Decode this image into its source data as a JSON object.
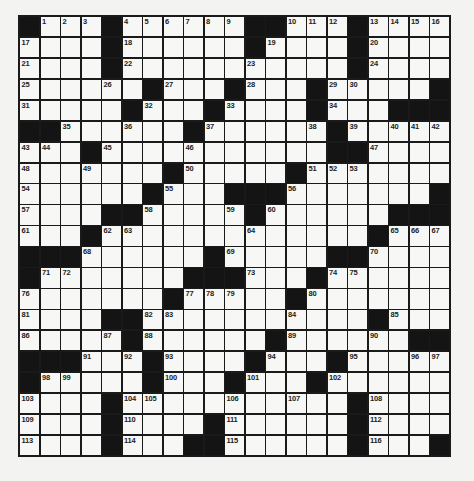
{
  "puzzle": {
    "rows": 21,
    "cols": 21,
    "colors": {
      "black_cell": "#141414",
      "white_cell": "#f7f7f5",
      "grid_line": "#1a1a1a",
      "background": "#f3f3f1"
    },
    "grid": [
      "#...#......##...#....",
      "....#......#....#....",
      "....#...........#....",
      "......#...#...#.....#",
      ".....#...#....#...###",
      "##......#......#.....",
      "...#...........##....",
      ".......#.....#.......",
      "......#...###.......#",
      "....##.....#......###",
      "...#.............#...",
      "###......#.....##....",
      "#.......###...#......",
      ".......#.....#.......",
      "....##...........#...",
      ".....#......#......##",
      "###...#....#...#.....",
      "#.....#...#...#......",
      "....#...........#....",
      "....#....#......#....",
      "....#...##......#...#"
    ],
    "numbers": [
      [
        0,
        1,
        1
      ],
      [
        0,
        2,
        2
      ],
      [
        0,
        3,
        3
      ],
      [
        0,
        5,
        4
      ],
      [
        0,
        6,
        5
      ],
      [
        0,
        7,
        6
      ],
      [
        0,
        8,
        7
      ],
      [
        0,
        9,
        8
      ],
      [
        0,
        10,
        9
      ],
      [
        0,
        13,
        10
      ],
      [
        0,
        14,
        11
      ],
      [
        0,
        15,
        12
      ],
      [
        0,
        17,
        13
      ],
      [
        0,
        18,
        14
      ],
      [
        0,
        19,
        15
      ],
      [
        0,
        20,
        16
      ],
      [
        1,
        0,
        17
      ],
      [
        1,
        5,
        18
      ],
      [
        1,
        12,
        19
      ],
      [
        1,
        17,
        20
      ],
      [
        2,
        0,
        21
      ],
      [
        2,
        5,
        22
      ],
      [
        2,
        11,
        23
      ],
      [
        2,
        17,
        24
      ],
      [
        3,
        0,
        25
      ],
      [
        3,
        4,
        26
      ],
      [
        3,
        7,
        27
      ],
      [
        3,
        11,
        28
      ],
      [
        3,
        15,
        29
      ],
      [
        3,
        16,
        30
      ],
      [
        4,
        0,
        31
      ],
      [
        4,
        6,
        32
      ],
      [
        4,
        10,
        33
      ],
      [
        4,
        15,
        34
      ],
      [
        5,
        2,
        35
      ],
      [
        5,
        5,
        36
      ],
      [
        5,
        9,
        37
      ],
      [
        5,
        14,
        38
      ],
      [
        5,
        16,
        39
      ],
      [
        5,
        18,
        40
      ],
      [
        5,
        19,
        41
      ],
      [
        5,
        20,
        42
      ],
      [
        6,
        0,
        43
      ],
      [
        6,
        1,
        44
      ],
      [
        6,
        4,
        45
      ],
      [
        6,
        8,
        46
      ],
      [
        6,
        17,
        47
      ],
      [
        7,
        0,
        48
      ],
      [
        7,
        3,
        49
      ],
      [
        7,
        8,
        50
      ],
      [
        7,
        14,
        51
      ],
      [
        7,
        15,
        52
      ],
      [
        7,
        16,
        53
      ],
      [
        8,
        0,
        54
      ],
      [
        8,
        7,
        55
      ],
      [
        8,
        13,
        56
      ],
      [
        9,
        0,
        57
      ],
      [
        9,
        6,
        58
      ],
      [
        9,
        10,
        59
      ],
      [
        9,
        12,
        60
      ],
      [
        10,
        0,
        61
      ],
      [
        10,
        4,
        62
      ],
      [
        10,
        5,
        63
      ],
      [
        10,
        11,
        64
      ],
      [
        10,
        18,
        65
      ],
      [
        10,
        19,
        66
      ],
      [
        10,
        20,
        67
      ],
      [
        11,
        3,
        68
      ],
      [
        11,
        10,
        69
      ],
      [
        11,
        17,
        70
      ],
      [
        12,
        1,
        71
      ],
      [
        12,
        2,
        72
      ],
      [
        12,
        11,
        73
      ],
      [
        12,
        15,
        74
      ],
      [
        12,
        16,
        75
      ],
      [
        13,
        0,
        76
      ],
      [
        13,
        8,
        77
      ],
      [
        13,
        9,
        78
      ],
      [
        13,
        10,
        79
      ],
      [
        13,
        14,
        80
      ],
      [
        14,
        0,
        81
      ],
      [
        14,
        6,
        82
      ],
      [
        14,
        7,
        83
      ],
      [
        14,
        13,
        84
      ],
      [
        14,
        18,
        85
      ],
      [
        15,
        0,
        86
      ],
      [
        15,
        4,
        87
      ],
      [
        15,
        6,
        88
      ],
      [
        15,
        13,
        89
      ],
      [
        15,
        17,
        90
      ],
      [
        16,
        3,
        91
      ],
      [
        16,
        5,
        92
      ],
      [
        16,
        7,
        93
      ],
      [
        16,
        12,
        94
      ],
      [
        16,
        16,
        95
      ],
      [
        16,
        19,
        96
      ],
      [
        16,
        20,
        97
      ],
      [
        17,
        1,
        98
      ],
      [
        17,
        2,
        99
      ],
      [
        17,
        7,
        100
      ],
      [
        17,
        11,
        101
      ],
      [
        17,
        15,
        102
      ],
      [
        18,
        0,
        103
      ],
      [
        18,
        5,
        104
      ],
      [
        18,
        6,
        105
      ],
      [
        18,
        10,
        106
      ],
      [
        18,
        13,
        107
      ],
      [
        18,
        17,
        108
      ],
      [
        19,
        0,
        109
      ],
      [
        19,
        5,
        110
      ],
      [
        19,
        10,
        111
      ],
      [
        19,
        17,
        112
      ],
      [
        20,
        0,
        113
      ],
      [
        20,
        5,
        114
      ],
      [
        20,
        10,
        115
      ],
      [
        20,
        17,
        116
      ]
    ]
  }
}
